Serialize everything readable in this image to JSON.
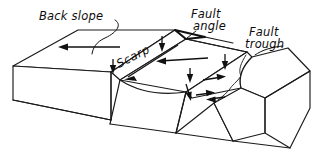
{
  "figure": {
    "kind": "geologic-block-diagram",
    "background_color": "#ffffff",
    "line_color": "#1a1a1a",
    "width": 320,
    "height": 159
  },
  "labels": {
    "back_slope": "Back slope",
    "scarp": "Scarp",
    "fault_angle_line1": "Fault",
    "fault_angle_line2": "angle",
    "fault_trough_line1": "Fault",
    "fault_trough_line2": "trough"
  },
  "annotations": {
    "back_slope_arrow": "arrow pointing left across back slope surface",
    "scarp_arrow": "arrow pointing down-left along scarp face",
    "downthrow_arrows": "short vertical arrows indicating downward displacement",
    "extension_arrows": "paired horizontal arrows indicating extension across fault trough",
    "fault_angle_mark": "angle wedge at top of scarp showing fault dip angle"
  }
}
